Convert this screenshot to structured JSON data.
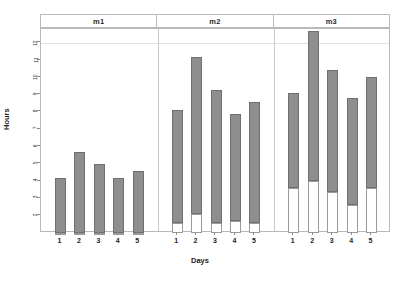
{
  "chart_data": {
    "type": "bar",
    "title": "",
    "subtitle": "",
    "xlabel": "Days",
    "ylabel": "Hours",
    "ylim": [
      1,
      12.8
    ],
    "yticks": [
      2,
      3,
      4,
      5,
      6,
      7,
      8,
      9,
      10,
      11,
      12
    ],
    "grid": true,
    "gridlines_y": [
      12
    ],
    "legend": "none",
    "stacked": true,
    "panel_variable": "method",
    "panels": [
      "m1",
      "m2",
      "m3"
    ],
    "categories": [
      "1",
      "2",
      "3",
      "4",
      "5"
    ],
    "series": [
      {
        "name": "base",
        "color": "#ffffff"
      },
      {
        "name": "top",
        "color": "#8e8e8e"
      }
    ],
    "panel_data": [
      {
        "panel": "m1",
        "categories": [
          "1",
          "2",
          "3",
          "4",
          "5"
        ],
        "base": [
          1.0,
          1.0,
          1.0,
          1.0,
          1.0
        ],
        "top": [
          4.2,
          5.7,
          5.0,
          4.2,
          4.6
        ],
        "totals": [
          4.2,
          5.7,
          5.0,
          4.2,
          4.6
        ]
      },
      {
        "panel": "m2",
        "categories": [
          "1",
          "2",
          "3",
          "4",
          "5"
        ],
        "base": [
          1.6,
          2.1,
          1.6,
          1.7,
          1.6
        ],
        "top": [
          8.1,
          11.2,
          9.3,
          7.9,
          8.6
        ],
        "totals": [
          8.1,
          11.2,
          9.3,
          7.9,
          8.6
        ]
      },
      {
        "panel": "m3",
        "categories": [
          "1",
          "2",
          "3",
          "4",
          "5"
        ],
        "base": [
          3.6,
          4.0,
          3.4,
          2.6,
          3.6
        ],
        "top": [
          9.1,
          12.7,
          10.4,
          8.8,
          10.0
        ],
        "totals": [
          9.1,
          12.7,
          10.4,
          8.8,
          10.0
        ]
      }
    ]
  },
  "axes": {
    "y_title": "Hours",
    "x_title": "Days",
    "y_tick_labels": [
      "12",
      "11",
      "10",
      "9",
      "8",
      "7",
      "6",
      "5",
      "4",
      "3",
      "2"
    ],
    "x_tick_labels": [
      "1",
      "2",
      "3",
      "4",
      "5"
    ]
  },
  "strip": {
    "labels": [
      "m1",
      "m2",
      "m3"
    ]
  },
  "colors": {
    "bar_fill": "#8e8e8e",
    "bar_base_fill": "#ffffff",
    "bar_border": "#6f6f6f",
    "frame": "#b9b9b9",
    "grid": "#e2e2e2",
    "text": "#1d1d1d",
    "background": "#ffffff"
  }
}
